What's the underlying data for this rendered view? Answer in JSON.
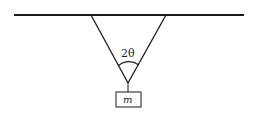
{
  "diagram": {
    "labels": {
      "angle": "2θ",
      "mass": "m"
    },
    "colors": {
      "stroke": "#1a1a1a",
      "background": "#ffffff"
    }
  }
}
